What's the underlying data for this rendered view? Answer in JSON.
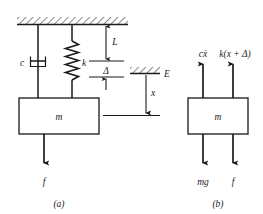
{
  "figure": {
    "type": "engineering-diagram",
    "colors": {
      "stroke": "#1a1a1a",
      "hatch": "#1a1a1a",
      "background": "#ffffff",
      "text": "#1a1a1a"
    },
    "panels": [
      {
        "id": "a",
        "caption": "(a)",
        "name": "physical-model",
        "labels": {
          "damper": "c",
          "spring": "k",
          "mass": "m",
          "applied_force": "f",
          "free_length": "L",
          "static_deflection": "Δ",
          "equilibrium": "E",
          "displacement": "x"
        }
      },
      {
        "id": "b",
        "caption": "(b)",
        "name": "free-body-diagram",
        "labels": {
          "mass": "m",
          "damping_force": "cẋ",
          "spring_force": "k(x + Δ)",
          "weight": "mg",
          "applied_force": "f"
        }
      }
    ]
  }
}
